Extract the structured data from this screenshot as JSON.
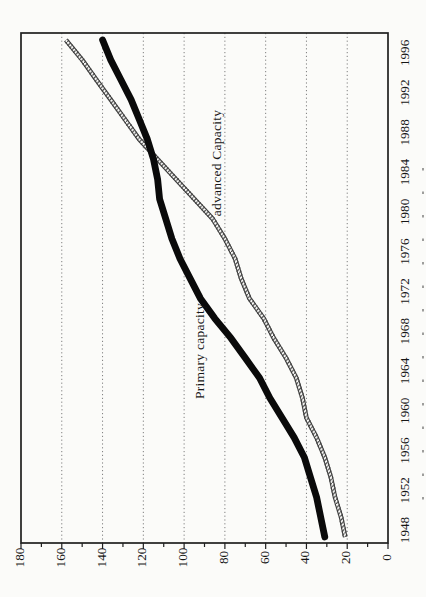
{
  "chart_data": {
    "type": "line",
    "title": "",
    "orientation": "chart is printed rotated 90deg counter-clockwise on a portrait page: year axis runs bottom-to-top along the right edge, value axis 0-180 runs right-to-left along the bottom edge, all text reads bottom-to-top",
    "x": [
      1948,
      1950,
      1952,
      1954,
      1956,
      1958,
      1960,
      1962,
      1964,
      1966,
      1968,
      1970,
      1972,
      1974,
      1976,
      1978,
      1980,
      1982,
      1984,
      1986,
      1988,
      1990,
      1992,
      1994,
      1996,
      1998
    ],
    "series": [
      {
        "name": "Primary capacity",
        "line_style": "solid thick black",
        "values": [
          31,
          33,
          35,
          38,
          41,
          46,
          52,
          58,
          63,
          70,
          77,
          85,
          92,
          97,
          102,
          106,
          109,
          112,
          113,
          115,
          118,
          122,
          126,
          131,
          136,
          140
        ]
      },
      {
        "name": "advanced Capacity",
        "line_style": "thin double line with diagonal slash hatching",
        "values": [
          21,
          23,
          26,
          28,
          31,
          35,
          40,
          42,
          45,
          50,
          56,
          61,
          68,
          72,
          75,
          80,
          86,
          95,
          104,
          113,
          122,
          129,
          136,
          143,
          150,
          158
        ]
      }
    ],
    "year_axis": {
      "range": [
        1948,
        1998
      ],
      "tick_labels": [
        "1948",
        "1952",
        "1956",
        "1960",
        "1964",
        "1968",
        "1972",
        "1976",
        "1980",
        "1984",
        "1988",
        "1992",
        "1996"
      ],
      "label_step": 4
    },
    "value_axis": {
      "range": [
        0,
        180
      ],
      "major_tick_step": 20,
      "minor_tick_step": 10,
      "tick_labels": [
        "0",
        "20",
        "40",
        "60",
        "80",
        "100",
        "120",
        "140",
        "160",
        "180"
      ]
    },
    "grid": {
      "value_gridlines_step": 20,
      "style": "dotted gray lines across plot"
    },
    "legend_position": "inline rotated labels next to each line"
  },
  "colors": {
    "paper": "#fbfbf9",
    "plot_border": "#1f1f1f",
    "gridline": "#7f7f7f",
    "primary_line": "#0a0a0a",
    "advanced_line": "#3d3d3d",
    "axis_text": "#161616"
  }
}
